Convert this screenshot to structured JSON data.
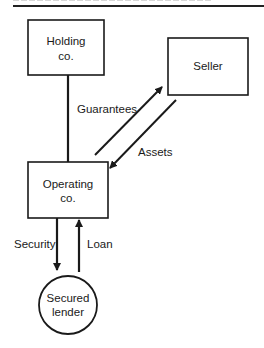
{
  "header": {
    "heading_cut_off": true,
    "rule": true
  },
  "nodes": {
    "holding": {
      "line1": "Holding",
      "line2": "co."
    },
    "seller": {
      "line1": "Seller"
    },
    "operating": {
      "line1": "Operating",
      "line2": "co."
    },
    "lender": {
      "line1": "Secured",
      "line2": "lender"
    }
  },
  "edges": {
    "guarantees": {
      "label": "Guarantees",
      "from": "holding",
      "to": "operating",
      "style": "line"
    },
    "to_seller": {
      "label": "",
      "from": "operating",
      "to": "seller",
      "style": "arrow"
    },
    "assets": {
      "label": "Assets",
      "from": "seller",
      "to": "operating",
      "style": "arrow"
    },
    "security": {
      "label": "Security",
      "from": "operating",
      "to": "lender",
      "style": "arrow"
    },
    "loan": {
      "label": "Loan",
      "from": "lender",
      "to": "operating",
      "style": "arrow"
    }
  },
  "colors": {
    "stroke": "#1a1a1a",
    "background": "#ffffff"
  }
}
